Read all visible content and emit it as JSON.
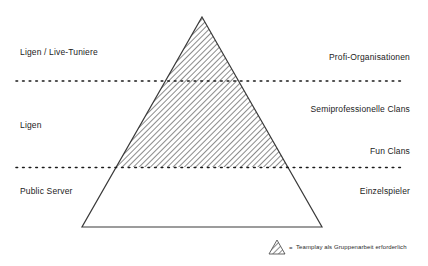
{
  "diagram": {
    "type": "pyramid",
    "title_visible": false,
    "background_color": "#ffffff",
    "outline_color": "#333333",
    "hatch_color": "#6b6b6b",
    "dotted_line_color": "#1a1a1a",
    "geometry": {
      "apex": {
        "x": 202,
        "y": 17
      },
      "base_left": {
        "x": 82,
        "y": 227
      },
      "base_right": {
        "x": 322,
        "y": 227
      },
      "divider_y_upper": 81,
      "divider_y_lower": 167,
      "dotted_line_x_start": 16,
      "dotted_line_x_end": 402
    },
    "hatched_region": {
      "from_y": 17,
      "to_y": 167,
      "description": "hatched-upper-and-middle-band"
    },
    "left_labels": [
      {
        "id": "ligen-live-tuniere",
        "text": "Ligen / Live-Tuniere"
      },
      {
        "id": "ligen",
        "text": "Ligen"
      },
      {
        "id": "public-server",
        "text": "Public Server"
      }
    ],
    "right_labels": [
      {
        "id": "profi-organisationen",
        "text": "Profi-Organisationen"
      },
      {
        "id": "semiprofessionelle-clans",
        "text": "Semiprofessionelle Clans"
      },
      {
        "id": "fun-clans",
        "text": "Fun Clans"
      },
      {
        "id": "einzelspieler",
        "text": "Einzelspieler"
      }
    ],
    "legend": {
      "icon": "hatched-triangle-icon",
      "equals_sign": "=",
      "text": "Teamplay als Gruppenarbeit erforderlich"
    }
  }
}
